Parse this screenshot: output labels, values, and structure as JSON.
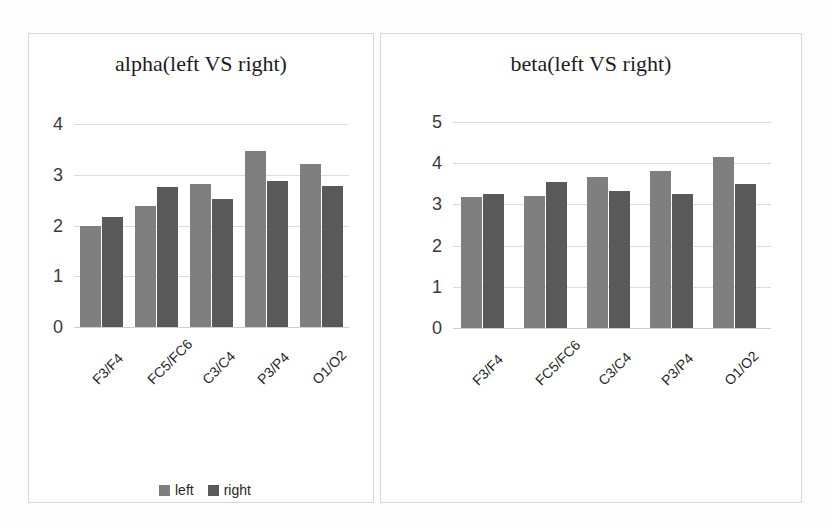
{
  "colors": {
    "series_left": "#7f7f7f",
    "series_right": "#595959",
    "gridline": "#dcdcdc",
    "panel_border": "#d8d8d8",
    "text": "#1f1f1f"
  },
  "charts": [
    {
      "id": "alpha",
      "title": "alpha(left VS right)",
      "legend": {
        "position": "bottom-center",
        "entries": [
          "left",
          "right"
        ]
      },
      "yticks": [
        "4",
        "3",
        "2",
        "1",
        "0"
      ],
      "xticks": [
        "F3/F4",
        "FC5/FC6",
        "C3/C4",
        "P3/P4",
        "O1/O2"
      ]
    },
    {
      "id": "beta",
      "title": "beta(left VS right)",
      "legend": {
        "position": "bottom-center",
        "entries": [
          "left",
          "right"
        ]
      },
      "yticks": [
        "5",
        "4",
        "3",
        "2",
        "1",
        "0"
      ],
      "xticks": [
        "F3/F4",
        "FC5/FC6",
        "C3/C4",
        "P3/P4",
        "O1/O2"
      ]
    }
  ],
  "chart_data": [
    {
      "type": "bar",
      "title": "alpha(left VS right)",
      "xlabel": "",
      "ylabel": "",
      "ylim": [
        0,
        4
      ],
      "yticks": [
        0,
        1,
        2,
        3,
        4
      ],
      "grid": true,
      "legend": "bottom-center",
      "categories": [
        "F3/F4",
        "FC5/FC6",
        "C3/C4",
        "P3/P4",
        "O1/O2"
      ],
      "series": [
        {
          "name": "left",
          "color": "#7f7f7f",
          "values": [
            2.0,
            2.38,
            2.82,
            3.47,
            3.22
          ]
        },
        {
          "name": "right",
          "color": "#595959",
          "values": [
            2.17,
            2.75,
            2.52,
            2.88,
            2.78
          ]
        }
      ]
    },
    {
      "type": "bar",
      "title": "beta(left VS right)",
      "xlabel": "",
      "ylabel": "",
      "ylim": [
        0,
        5
      ],
      "yticks": [
        0,
        1,
        2,
        3,
        4,
        5
      ],
      "grid": true,
      "legend": "bottom-center",
      "categories": [
        "F3/F4",
        "FC5/FC6",
        "C3/C4",
        "P3/P4",
        "O1/O2"
      ],
      "series": [
        {
          "name": "left",
          "color": "#7f7f7f",
          "values": [
            3.18,
            3.2,
            3.67,
            3.8,
            4.15
          ]
        },
        {
          "name": "right",
          "color": "#595959",
          "values": [
            3.25,
            3.55,
            3.33,
            3.25,
            3.5
          ]
        }
      ]
    }
  ]
}
